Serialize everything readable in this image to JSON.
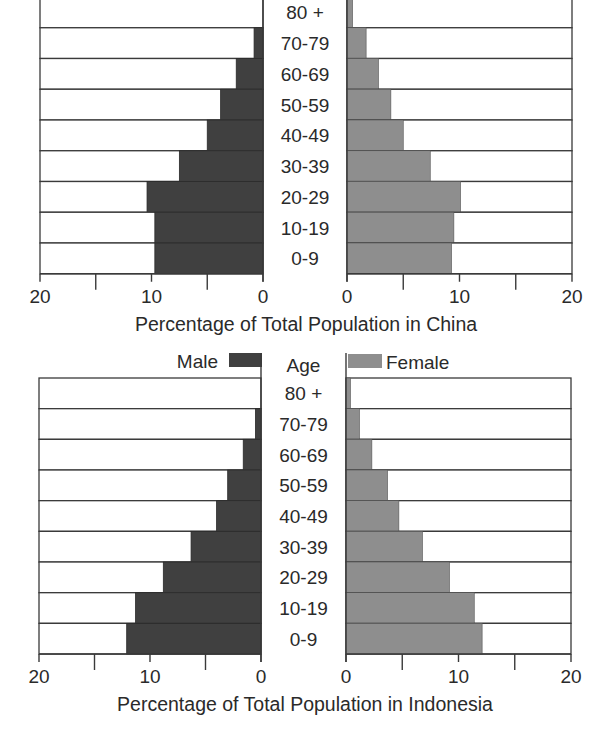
{
  "chart_data": [
    {
      "type": "bar",
      "subtype": "population-pyramid",
      "title": "Percentage of Total Population in China",
      "xlabel": "Percentage of Total Population in China",
      "ylabel": "Age",
      "categories": [
        "0-9",
        "10-19",
        "20-29",
        "30-39",
        "40-49",
        "50-59",
        "60-69",
        "70-79",
        "80 +"
      ],
      "series": [
        {
          "name": "Male",
          "color": "#404040",
          "values": [
            9.7,
            9.7,
            10.4,
            7.5,
            5.0,
            3.8,
            2.4,
            0.8,
            0.0
          ]
        },
        {
          "name": "Female",
          "color": "#8e8e8e",
          "values": [
            9.3,
            9.5,
            10.1,
            7.4,
            5.0,
            3.9,
            2.8,
            1.7,
            0.5
          ]
        }
      ],
      "xlim": [
        0,
        20
      ],
      "x_ticks": [
        20,
        10,
        0,
        0,
        10,
        20
      ],
      "minor_ticks": [
        15,
        5
      ],
      "grid": false,
      "legend_visible": false
    },
    {
      "type": "bar",
      "subtype": "population-pyramid",
      "title": "Percentage of Total Population in Indonesia",
      "xlabel": "Percentage of Total Population in Indonesia",
      "ylabel": "Age",
      "categories": [
        "0-9",
        "10-19",
        "20-29",
        "30-39",
        "40-49",
        "50-59",
        "60-69",
        "70-79",
        "80 +"
      ],
      "series": [
        {
          "name": "Male",
          "color": "#404040",
          "values": [
            12.1,
            11.3,
            8.8,
            6.3,
            4.0,
            3.0,
            1.6,
            0.5,
            0.0
          ]
        },
        {
          "name": "Female",
          "color": "#8e8e8e",
          "values": [
            12.1,
            11.4,
            9.2,
            6.8,
            4.7,
            3.7,
            2.3,
            1.2,
            0.4
          ]
        }
      ],
      "xlim": [
        0,
        20
      ],
      "x_ticks": [
        20,
        10,
        0,
        0,
        10,
        20
      ],
      "minor_ticks": [
        15,
        5
      ],
      "grid": false,
      "legend_visible": true,
      "legend_position": "top"
    }
  ],
  "charts": [
    {
      "name": "china",
      "axis_title": "Percentage of Total Population in China",
      "legend": null
    },
    {
      "name": "indonesia",
      "axis_title": "Percentage of Total Population in Indonesia",
      "legend": {
        "male": "Male",
        "age": "Age",
        "female": "Female"
      }
    }
  ],
  "tick_labels": [
    "20",
    "10",
    "0",
    "0",
    "10",
    "20"
  ],
  "colors": {
    "male": "#404040",
    "female": "#8e8e8e",
    "border": "#3a3a3a",
    "text": "#2a2a2a"
  }
}
